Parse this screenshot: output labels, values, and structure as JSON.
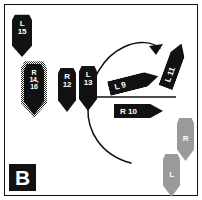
{
  "panel": {
    "letter": "B",
    "border_color": "#101010",
    "background_color": "#ffffff",
    "marker_color": "#121212",
    "gray_marker_color": "#9a9a9a",
    "text_color": "#ffffff"
  },
  "markers": [
    {
      "id": "l15",
      "label_lines": [
        "L",
        "15"
      ],
      "style": "solid",
      "color": "#121212",
      "x": 12,
      "y": 14,
      "w": 20,
      "h": 43,
      "font_size": 8
    },
    {
      "id": "r14_16",
      "label_lines": [
        "R",
        "14,",
        "16"
      ],
      "style": "dotted",
      "color": "#121212",
      "x": 24,
      "y": 63,
      "w": 20,
      "h": 52,
      "font_size": 7
    },
    {
      "id": "r12",
      "label_lines": [
        "R",
        "12"
      ],
      "style": "solid",
      "color": "#121212",
      "x": 58,
      "y": 67,
      "w": 18,
      "h": 45,
      "font_size": 8
    },
    {
      "id": "l13",
      "label_lines": [
        "L",
        "13"
      ],
      "style": "solid",
      "color": "#121212",
      "x": 79,
      "y": 65,
      "w": 18,
      "h": 46,
      "font_size": 8
    },
    {
      "id": "gray_r",
      "label_lines": [
        "R"
      ],
      "style": "gray",
      "color": "#9a9a9a",
      "x": 177,
      "y": 117,
      "w": 17,
      "h": 44,
      "font_size": 8
    },
    {
      "id": "gray_l",
      "label_lines": [
        "L"
      ],
      "style": "gray",
      "color": "#9a9a9a",
      "x": 163,
      "y": 153,
      "w": 17,
      "h": 44,
      "font_size": 8
    }
  ],
  "arrows": [
    {
      "id": "l9",
      "label": "L 9",
      "x": 108,
      "y": 75,
      "w": 51,
      "h": 15,
      "rotation": -14,
      "font_size": 8
    },
    {
      "id": "l11",
      "label": "L 11",
      "x": 150,
      "y": 58,
      "w": 47,
      "h": 15,
      "rotation": -70,
      "font_size": 8
    },
    {
      "id": "r10",
      "label": "R 10",
      "x": 114,
      "y": 104,
      "w": 49,
      "h": 14,
      "rotation": 0,
      "font_size": 8
    }
  ],
  "annotations": {
    "arc": {
      "name": "clockwise-sweep-arc",
      "stroke": "#101010",
      "stroke_width": 1.4
    },
    "axis_line": {
      "name": "horizontal-axis-line",
      "stroke": "#101010",
      "stroke_width": 1.3
    }
  }
}
